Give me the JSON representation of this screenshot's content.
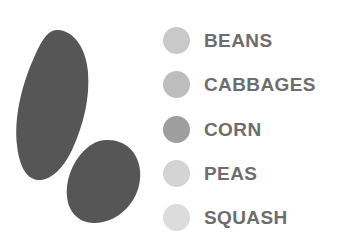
{
  "figure": {
    "background_color": "#ffffff",
    "shape_fill_color": "#565656",
    "label_text_color": "#6d6d6d"
  },
  "shapes": {
    "items": [
      {
        "name": "large-blob",
        "fill": "#565656",
        "path": "M58,30 C74,31 86,48 88,72 C90,97 84,124 72,150 C63,169 50,181 38,180 C26,179 19,165 17,145 C14,119 21,87 33,60 C41,41 48,29 58,30 Z"
      },
      {
        "name": "small-blob",
        "fill": "#565656",
        "path": "M106,140 C124,139 138,151 140,170 C142,190 131,210 112,219 C94,227 77,223 70,208 C63,192 68,169 81,154 C89,145 97,140 106,140 Z"
      }
    ]
  },
  "legend": {
    "items": [
      {
        "label": "BEANS",
        "color": "#c9c9c9"
      },
      {
        "label": "CABBAGES",
        "color": "#bdbdbd"
      },
      {
        "label": "CORN",
        "color": "#9e9e9e"
      },
      {
        "label": "PEAS",
        "color": "#d4d4d4"
      },
      {
        "label": "SQUASH",
        "color": "#dcdcdc"
      }
    ]
  },
  "chart_data": {
    "type": "table",
    "title": "",
    "xlabel": "",
    "ylabel": "",
    "categories": [
      "BEANS",
      "CABBAGES",
      "CORN",
      "PEAS",
      "SQUASH"
    ],
    "legend_position": "right",
    "grid": false,
    "series": [
      {
        "name": "Legend swatch color",
        "values": [
          "#c9c9c9",
          "#bdbdbd",
          "#9e9e9e",
          "#d4d4d4",
          "#dcdcdc"
        ]
      }
    ],
    "annotations": [
      "Two dark gray organic blob shapes at left, fill #565656",
      "Five-entry categorical legend at right with circular swatches"
    ]
  }
}
